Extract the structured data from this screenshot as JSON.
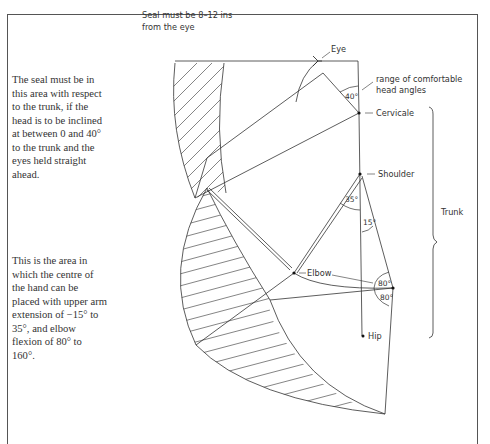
{
  "notes": {
    "seal_area": "The seal must be in this area with respect to the trunk, if the head is to be inclined at between 0 and 40° to the trunk and the eyes held straight ahead.",
    "hand_area": "This is the area in which the centre of the hand can be placed with upper arm extension of −15° to 35°, and elbow flexion of 80° to 160°."
  },
  "labels": {
    "seal_distance_line1": "Seal must be 8–12 ins",
    "seal_distance_line2": "from the eye",
    "eye": "Eye",
    "head_range_line1": "range of comfortable",
    "head_range_line2": "head angles",
    "cervicale": "Cervicale",
    "shoulder": "Shoulder",
    "trunk": "Trunk",
    "elbow": "Elbow",
    "hip": "Hip"
  },
  "angles": {
    "head": "40°",
    "arm_forward": "35°",
    "arm_back": "15°",
    "elbow_upper": "80°",
    "elbow_lower": "80°"
  }
}
